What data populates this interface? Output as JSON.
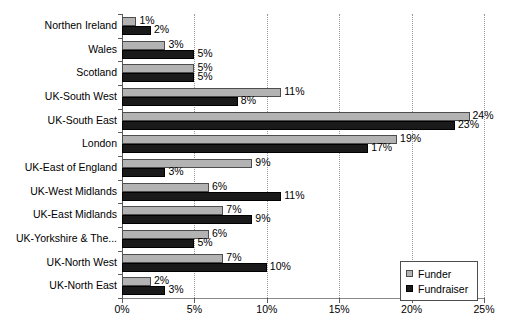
{
  "chart_data": {
    "type": "bar",
    "orientation": "horizontal",
    "title": "",
    "xlabel": "",
    "ylabel": "",
    "xlim": [
      0,
      25
    ],
    "xticks": [
      "0%",
      "5%",
      "10%",
      "15%",
      "20%",
      "25%"
    ],
    "xtick_values": [
      0,
      5,
      10,
      15,
      20,
      25
    ],
    "grid": "vertical-dotted",
    "legend_position": "lower-right",
    "value_suffix": "%",
    "categories": [
      "Northen Ireland",
      "Wales",
      "Scotland",
      "UK-South West",
      "UK-South East",
      "London",
      "UK-East of England",
      "UK-West Midlands",
      "UK-East Midlands",
      "UK-Yorkshire & The...",
      "UK-North West",
      "UK-North East"
    ],
    "series": [
      {
        "name": "Funder",
        "color": "#b3b3b3",
        "values": [
          1,
          3,
          5,
          11,
          24,
          19,
          9,
          6,
          7,
          6,
          7,
          2
        ],
        "labels": [
          "1%",
          "3%",
          "5%",
          "11%",
          "24%",
          "19%",
          "9%",
          "6%",
          "7%",
          "6%",
          "7%",
          "2%"
        ]
      },
      {
        "name": "Fundraiser",
        "color": "#1a1a1a",
        "values": [
          2,
          5,
          5,
          8,
          23,
          17,
          3,
          11,
          9,
          5,
          10,
          3
        ],
        "labels": [
          "2%",
          "5%",
          "5%",
          "8%",
          "23%",
          "17%",
          "3%",
          "11%",
          "9%",
          "5%",
          "10%",
          "3%"
        ]
      }
    ]
  },
  "legend": {
    "items": [
      {
        "label": "Funder"
      },
      {
        "label": "Fundraiser"
      }
    ]
  }
}
